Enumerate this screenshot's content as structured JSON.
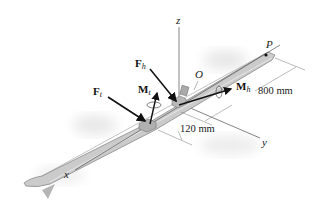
{
  "diagram": {
    "axes": {
      "x_label": "x",
      "y_label": "y",
      "z_label": "z",
      "origin_label": "O"
    },
    "points": {
      "p_label": "P"
    },
    "forces": {
      "f_heel": {
        "symbol": "F",
        "subscript": "h"
      },
      "f_toe": {
        "symbol": "F",
        "subscript": "t"
      }
    },
    "moments": {
      "m_heel": {
        "symbol": "M",
        "subscript": "h"
      },
      "m_toe": {
        "symbol": "M",
        "subscript": "t"
      }
    },
    "dimensions": {
      "length_op": "800 mm",
      "length_toe": "120 mm"
    },
    "colors": {
      "ski_fill": "#c9c9c9",
      "ski_edge": "#8a8a8a",
      "arrow": "#111111",
      "axis": "#555555",
      "shadow": "#e6e6e6"
    }
  }
}
